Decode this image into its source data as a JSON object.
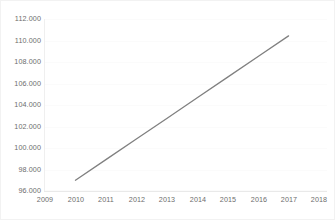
{
  "chart_data": {
    "type": "line",
    "title": "",
    "subtitle": "",
    "xlabel": "",
    "ylabel": "",
    "grid": true,
    "legend": false,
    "legend_position": "none",
    "line_color": "#808080",
    "background_color": "#ffffff",
    "gridline_color": "#fbfbfb",
    "tick_label_color": "#6d6d6d",
    "number_format": "thousands-separator-period",
    "xlim": [
      2009,
      2018
    ],
    "ylim": [
      96000,
      112000
    ],
    "y_tick_step": 2000,
    "x_tick_step": 1,
    "x_tick_labels": [
      "2009",
      "2010",
      "2011",
      "2012",
      "2013",
      "2014",
      "2015",
      "2016",
      "2017",
      "2018"
    ],
    "y_tick_labels": [
      "96.000",
      "98.000",
      "100.000",
      "102.000",
      "104.000",
      "106.000",
      "108.000",
      "110.000",
      "112.000"
    ],
    "x_tick_values": [
      2009,
      2010,
      2011,
      2012,
      2013,
      2014,
      2015,
      2016,
      2017,
      2018
    ],
    "y_tick_values": [
      96000,
      98000,
      100000,
      102000,
      104000,
      106000,
      108000,
      110000,
      112000
    ],
    "series": [
      {
        "name": "",
        "x": [
          2010,
          2011,
          2012,
          2013,
          2014,
          2015,
          2016,
          2017
        ],
        "values": [
          97000,
          98920,
          100840,
          102750,
          104670,
          106590,
          108510,
          110430
        ]
      }
    ]
  }
}
